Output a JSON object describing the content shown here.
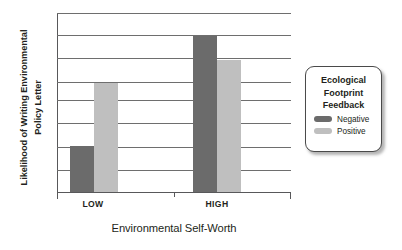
{
  "chart_data": {
    "type": "bar",
    "title": "",
    "xlabel": "Environmental Self-Worth",
    "ylabel_lines": [
      "Likelihood of Writing Environmental",
      "Policy Letter"
    ],
    "ylabel": "Likelihood of Writing Environmental Policy Letter",
    "categories": [
      "LOW",
      "HIGH"
    ],
    "series": [
      {
        "name": "Negative",
        "color": "#6b6b6b",
        "values": [
          2.0,
          6.7
        ]
      },
      {
        "name": "Positive",
        "color": "#bfbfbf",
        "values": [
          4.7,
          5.7
        ]
      }
    ],
    "ylim": [
      0,
      7.7
    ],
    "y_gridline_values": [
      0.95,
      1.95,
      2.95,
      3.95,
      4.75,
      5.75,
      6.75,
      7.7
    ],
    "grid": true,
    "y_tick_labels": [],
    "legend": {
      "position": "right",
      "title_lines": [
        "Ecological",
        "Footprint",
        "Feedback"
      ],
      "title": "Ecological Footprint Feedback",
      "entries": [
        {
          "label": "Negative",
          "color": "#6b6b6b"
        },
        {
          "label": "Positive",
          "color": "#bfbfbf"
        }
      ]
    }
  },
  "colors": {
    "negative": "#6b6b6b",
    "positive": "#bfbfbf",
    "grid": "#6e6e6e",
    "axis": "#58585a",
    "text": "#231f20",
    "background": "#ffffff"
  }
}
